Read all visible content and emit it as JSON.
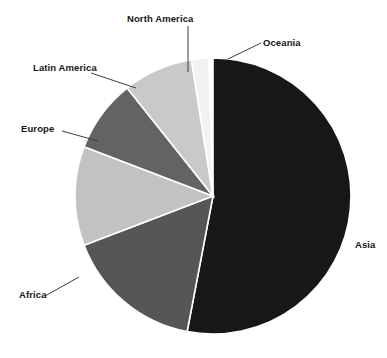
{
  "chart_data": {
    "type": "pie",
    "title": "",
    "subtitle": "",
    "xlabel": "",
    "ylabel": "",
    "legend_position": "none",
    "grid": false,
    "label_style": "callout-leader-lines",
    "categories": [
      "Asia",
      "Africa",
      "Europe",
      "Latin America",
      "North America",
      "Oceania"
    ],
    "values": [
      53.0,
      16.2,
      11.6,
      8.5,
      8.2,
      0.5
    ],
    "units": "percent",
    "start_angle_deg": 0,
    "direction": "clockwise",
    "slices": [
      {
        "label": "Asia",
        "value": 53.0,
        "color": "#171717",
        "start_angle_deg": 0.0,
        "end_angle_deg": 190.8
      },
      {
        "label": "Africa",
        "value": 16.2,
        "color": "#565656",
        "start_angle_deg": 190.8,
        "end_angle_deg": 249.1
      },
      {
        "label": "Europe",
        "value": 11.6,
        "color": "#c2c2c2",
        "start_angle_deg": 249.1,
        "end_angle_deg": 290.9
      },
      {
        "label": "Latin America",
        "value": 8.5,
        "color": "#636363",
        "start_angle_deg": 290.9,
        "end_angle_deg": 321.5
      },
      {
        "label": "North America",
        "value": 8.2,
        "color": "#c9c9c9",
        "start_angle_deg": 321.5,
        "end_angle_deg": 351.0
      },
      {
        "label": "Oceania",
        "value": 0.5,
        "color": "#f2f2f2",
        "start_angle_deg": 351.0,
        "end_angle_deg": 358.2
      }
    ],
    "geometry": {
      "center_x": 213,
      "center_y": 196,
      "radius": 138
    },
    "colors": {
      "background": "#ffffff",
      "label_text": "#151515",
      "leader_line": "#3d3d3d",
      "slice_divider": "#ffffff"
    }
  },
  "labels": {
    "asia": "Asia",
    "africa": "Africa",
    "europe": "Europe",
    "latin_america": "Latin America",
    "north_america": "North America",
    "oceania": "Oceania"
  }
}
